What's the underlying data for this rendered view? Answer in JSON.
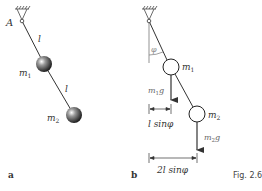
{
  "figure": {
    "caption": "Fig. 2.6",
    "panel_a": {
      "label": "a",
      "pivot_label": "A",
      "rod1_label": "l",
      "rod2_label": "l",
      "mass1_label": "m",
      "mass1_sub": "1",
      "mass2_label": "m",
      "mass2_sub": "2"
    },
    "panel_b": {
      "label": "b",
      "pivot_label": "A",
      "angle_label": "φ",
      "mass1_label": "m",
      "mass1_sub": "1",
      "mass2_label": "m",
      "mass2_sub": "2",
      "force1_label": "m",
      "force1_sub": "1",
      "force1_g": "g",
      "force2_label": "m",
      "force2_sub": "2",
      "force2_g": "g",
      "dim1_label": "l sinφ",
      "dim2_label": "2l sinφ"
    }
  }
}
